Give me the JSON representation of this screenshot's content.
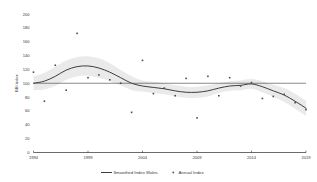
{
  "chart_data": {
    "type": "line",
    "title": "",
    "subtitle": "",
    "xlabel": "",
    "ylabel": "BBI index",
    "xlim": [
      1994,
      2019
    ],
    "ylim": [
      0,
      200
    ],
    "grid": false,
    "legend_position": "bottom",
    "x_ticks": [
      1994,
      1999,
      2004,
      2009,
      2014,
      2019
    ],
    "y_ticks": [
      0,
      20,
      40,
      60,
      80,
      100,
      120,
      140,
      160,
      180,
      200
    ],
    "reference_line": {
      "value": 100,
      "orientation": "horizontal"
    },
    "x": [
      1994,
      1995,
      1996,
      1997,
      1998,
      1999,
      2000,
      2001,
      2002,
      2003,
      2004,
      2005,
      2006,
      2007,
      2008,
      2009,
      2010,
      2011,
      2012,
      2013,
      2014,
      2015,
      2016,
      2017,
      2018,
      2019
    ],
    "series": [
      {
        "name": "Annual Index",
        "type": "scatter",
        "values": [
          116,
          74,
          126,
          90,
          172,
          108,
          112,
          105,
          100,
          58,
          133,
          85,
          93,
          82,
          107,
          50,
          110,
          82,
          108,
          96,
          101,
          78,
          81,
          84,
          72,
          62
        ]
      },
      {
        "name": "Smoothed Index Wales",
        "type": "line",
        "values": [
          100,
          103,
          110,
          119,
          124,
          125,
          122,
          116,
          108,
          100,
          96,
          94,
          92,
          89,
          87,
          87,
          89,
          93,
          96,
          97,
          99,
          95,
          89,
          83,
          74,
          64
        ]
      },
      {
        "name": "Confidence band upper",
        "type": "band",
        "values": [
          110,
          115,
          124,
          133,
          138,
          139,
          136,
          129,
          119,
          110,
          104,
          102,
          100,
          97,
          95,
          95,
          97,
          100,
          103,
          104,
          106,
          103,
          98,
          93,
          85,
          75
        ]
      },
      {
        "name": "Confidence band lower",
        "type": "band",
        "values": [
          90,
          91,
          96,
          105,
          110,
          111,
          108,
          103,
          97,
          90,
          88,
          86,
          84,
          81,
          79,
          79,
          81,
          86,
          89,
          90,
          92,
          87,
          80,
          73,
          63,
          53
        ]
      }
    ]
  },
  "legend": {
    "items": [
      {
        "label": "Smoothed Index Wales",
        "marker": "line"
      },
      {
        "label": "Annual Index",
        "marker": "square-point"
      }
    ]
  },
  "axes": {
    "y_label": "BBI index",
    "y_tick_labels": [
      "200",
      "180",
      "160",
      "140",
      "120",
      "100",
      "80",
      "60",
      "40",
      "20",
      "0"
    ],
    "x_tick_labels": [
      "1994",
      "1999",
      "2004",
      "2009",
      "2014",
      "2019"
    ]
  }
}
